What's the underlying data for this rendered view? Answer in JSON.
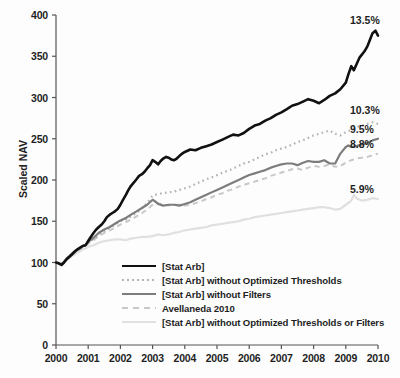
{
  "chart_data": {
    "type": "line",
    "title": "",
    "xlabel": "",
    "ylabel": "Scaled NAV",
    "xlim": [
      2000,
      2010
    ],
    "ylim": [
      0,
      400
    ],
    "grid": false,
    "legend_position": "inside-lower-center",
    "yticks": [
      0,
      50,
      100,
      150,
      200,
      250,
      300,
      350,
      400
    ],
    "xticks": [
      2000,
      2001,
      2002,
      2003,
      2004,
      2005,
      2006,
      2007,
      2008,
      2009,
      2010
    ],
    "ytick_labels": [
      "0",
      "50",
      "100",
      "150",
      "200",
      "250",
      "300",
      "350",
      "400"
    ],
    "xtick_labels": [
      "2000",
      "2001",
      "2002",
      "2003",
      "2004",
      "2005",
      "2006",
      "2007",
      "2008",
      "2009",
      "2010"
    ],
    "annotations": [
      {
        "text": "13.5%",
        "series": "[Stat Arb]",
        "x": 2010,
        "y": 375
      },
      {
        "text": "10.3%",
        "series": "[Stat Arb] without Optimized Thresholds",
        "x": 2010,
        "y": 268
      },
      {
        "text": "9.5%",
        "series": "[Stat Arb] without Filters",
        "x": 2010,
        "y": 250
      },
      {
        "text": "8.8%",
        "series": "Avellaneda 2010",
        "x": 2010,
        "y": 232
      },
      {
        "text": "5.9%",
        "series": "[Stat Arb] without Optimized Thresholds or Filters",
        "x": 2010,
        "y": 177
      }
    ],
    "series": [
      {
        "name": "[Stat Arb]",
        "color": "#111111",
        "style": "solid",
        "width": 2.6,
        "final_value": 375,
        "annual_return": "13.5%",
        "x": [
          2000.0,
          2000.08,
          2000.17,
          2000.25,
          2000.33,
          2000.42,
          2000.5,
          2000.58,
          2000.67,
          2000.75,
          2000.83,
          2000.92,
          2001.0,
          2001.08,
          2001.17,
          2001.25,
          2001.33,
          2001.42,
          2001.5,
          2001.58,
          2001.67,
          2001.75,
          2001.83,
          2001.92,
          2002.0,
          2002.08,
          2002.17,
          2002.25,
          2002.33,
          2002.42,
          2002.5,
          2002.58,
          2002.67,
          2002.75,
          2002.83,
          2002.92,
          2003.0,
          2003.08,
          2003.17,
          2003.25,
          2003.33,
          2003.42,
          2003.5,
          2003.58,
          2003.67,
          2003.75,
          2003.83,
          2003.92,
          2004.0,
          2004.17,
          2004.33,
          2004.5,
          2004.67,
          2004.83,
          2005.0,
          2005.17,
          2005.33,
          2005.5,
          2005.67,
          2005.83,
          2006.0,
          2006.17,
          2006.33,
          2006.5,
          2006.67,
          2006.83,
          2007.0,
          2007.17,
          2007.33,
          2007.5,
          2007.67,
          2007.83,
          2008.0,
          2008.17,
          2008.33,
          2008.5,
          2008.67,
          2008.83,
          2009.0,
          2009.08,
          2009.17,
          2009.25,
          2009.33,
          2009.42,
          2009.5,
          2009.58,
          2009.67,
          2009.75,
          2009.83,
          2009.92,
          2010.0
        ],
        "y": [
          100,
          99,
          97,
          100,
          104,
          107,
          110,
          113,
          116,
          118,
          120,
          121,
          126,
          131,
          136,
          140,
          143,
          146,
          150,
          155,
          158,
          160,
          162,
          165,
          170,
          176,
          182,
          188,
          193,
          197,
          201,
          205,
          207,
          210,
          214,
          218,
          224,
          222,
          219,
          223,
          226,
          228,
          227,
          225,
          224,
          226,
          229,
          232,
          234,
          237,
          236,
          239,
          241,
          243,
          246,
          249,
          252,
          255,
          254,
          257,
          262,
          266,
          268,
          272,
          275,
          279,
          282,
          286,
          290,
          292,
          295,
          298,
          296,
          293,
          297,
          302,
          305,
          310,
          318,
          328,
          338,
          333,
          340,
          348,
          352,
          356,
          362,
          370,
          378,
          381,
          375
        ]
      },
      {
        "name": "[Stat Arb] without Optimized Thresholds",
        "color": "#b4b4b4",
        "style": "dotted",
        "width": 2.2,
        "final_value": 268,
        "annual_return": "10.3%",
        "x": [
          2000.0,
          2000.08,
          2000.17,
          2000.25,
          2000.33,
          2000.42,
          2000.5,
          2000.58,
          2000.67,
          2000.75,
          2000.83,
          2000.92,
          2001.0,
          2001.17,
          2001.33,
          2001.5,
          2001.67,
          2001.83,
          2002.0,
          2002.17,
          2002.33,
          2002.5,
          2002.67,
          2002.83,
          2003.0,
          2003.17,
          2003.33,
          2003.5,
          2003.67,
          2003.83,
          2004.0,
          2004.17,
          2004.33,
          2004.5,
          2004.67,
          2004.83,
          2005.0,
          2005.17,
          2005.33,
          2005.5,
          2005.67,
          2005.83,
          2006.0,
          2006.17,
          2006.33,
          2006.5,
          2006.67,
          2006.83,
          2007.0,
          2007.17,
          2007.33,
          2007.5,
          2007.67,
          2007.83,
          2008.0,
          2008.17,
          2008.33,
          2008.5,
          2008.67,
          2008.83,
          2009.0,
          2009.17,
          2009.33,
          2009.5,
          2009.67,
          2009.83,
          2010.0
        ],
        "y": [
          100,
          99,
          98,
          101,
          105,
          108,
          110,
          113,
          115,
          117,
          119,
          121,
          124,
          129,
          134,
          138,
          142,
          146,
          150,
          152,
          156,
          160,
          166,
          172,
          181,
          183,
          184,
          185,
          186,
          188,
          190,
          192,
          195,
          198,
          201,
          203,
          206,
          209,
          211,
          214,
          217,
          220,
          222,
          225,
          228,
          231,
          233,
          236,
          238,
          240,
          243,
          246,
          248,
          251,
          254,
          256,
          258,
          260,
          256,
          254,
          258,
          261,
          264,
          266,
          268,
          270,
          268
        ]
      },
      {
        "name": "[Stat Arb] without Filters",
        "color": "#7d7d7d",
        "style": "solid",
        "width": 2.2,
        "final_value": 250,
        "annual_return": "9.5%",
        "x": [
          2000.0,
          2000.08,
          2000.17,
          2000.25,
          2000.33,
          2000.42,
          2000.5,
          2000.58,
          2000.67,
          2000.75,
          2000.83,
          2000.92,
          2001.0,
          2001.17,
          2001.33,
          2001.5,
          2001.67,
          2001.83,
          2002.0,
          2002.17,
          2002.33,
          2002.5,
          2002.67,
          2002.83,
          2003.0,
          2003.08,
          2003.17,
          2003.33,
          2003.5,
          2003.67,
          2003.83,
          2004.0,
          2004.17,
          2004.33,
          2004.5,
          2004.67,
          2004.83,
          2005.0,
          2005.17,
          2005.33,
          2005.5,
          2005.67,
          2005.83,
          2006.0,
          2006.17,
          2006.33,
          2006.5,
          2006.67,
          2006.83,
          2007.0,
          2007.17,
          2007.33,
          2007.5,
          2007.67,
          2007.83,
          2008.0,
          2008.17,
          2008.33,
          2008.5,
          2008.67,
          2008.83,
          2009.0,
          2009.08,
          2009.17,
          2009.33,
          2009.5,
          2009.67,
          2009.83,
          2010.0
        ],
        "y": [
          100,
          99,
          98,
          101,
          105,
          108,
          111,
          114,
          116,
          118,
          120,
          121,
          125,
          130,
          136,
          140,
          143,
          147,
          151,
          154,
          158,
          162,
          166,
          170,
          176,
          174,
          171,
          169,
          170,
          170,
          169,
          171,
          173,
          176,
          179,
          182,
          185,
          188,
          191,
          194,
          197,
          200,
          203,
          206,
          208,
          210,
          212,
          215,
          217,
          219,
          220,
          220,
          218,
          221,
          223,
          222,
          222,
          224,
          220,
          220,
          232,
          240,
          242,
          240,
          241,
          243,
          245,
          248,
          250
        ]
      },
      {
        "name": "Avellaneda 2010",
        "color": "#c8c8c8",
        "style": "dashed",
        "width": 2.0,
        "final_value": 232,
        "annual_return": "8.8%",
        "x": [
          2000.0,
          2000.08,
          2000.17,
          2000.25,
          2000.33,
          2000.42,
          2000.5,
          2000.58,
          2000.67,
          2000.75,
          2000.83,
          2000.92,
          2001.0,
          2001.17,
          2001.33,
          2001.5,
          2001.67,
          2001.83,
          2002.0,
          2002.17,
          2002.33,
          2002.5,
          2002.67,
          2002.83,
          2003.0,
          2003.17,
          2003.33,
          2003.5,
          2003.67,
          2003.83,
          2004.0,
          2004.17,
          2004.33,
          2004.5,
          2004.67,
          2004.83,
          2005.0,
          2005.17,
          2005.33,
          2005.5,
          2005.67,
          2005.83,
          2006.0,
          2006.17,
          2006.33,
          2006.5,
          2006.67,
          2006.83,
          2007.0,
          2007.17,
          2007.33,
          2007.5,
          2007.67,
          2007.83,
          2008.0,
          2008.17,
          2008.33,
          2008.5,
          2008.67,
          2008.83,
          2009.0,
          2009.17,
          2009.33,
          2009.5,
          2009.67,
          2009.83,
          2010.0
        ],
        "y": [
          100,
          99,
          98,
          100,
          104,
          107,
          109,
          112,
          114,
          116,
          118,
          120,
          123,
          127,
          132,
          136,
          139,
          142,
          146,
          149,
          152,
          156,
          160,
          164,
          170,
          172,
          170,
          169,
          170,
          170,
          169,
          170,
          172,
          174,
          177,
          179,
          182,
          184,
          187,
          189,
          192,
          194,
          196,
          198,
          200,
          202,
          205,
          207,
          209,
          211,
          213,
          214,
          212,
          215,
          217,
          216,
          217,
          219,
          216,
          217,
          221,
          224,
          226,
          227,
          228,
          230,
          232
        ]
      },
      {
        "name": "[Stat Arb] without Optimized Thresholds or Filters",
        "color": "#e0e0e0",
        "style": "solid",
        "width": 2.2,
        "final_value": 177,
        "annual_return": "5.9%",
        "x": [
          2000.0,
          2000.08,
          2000.17,
          2000.25,
          2000.33,
          2000.42,
          2000.5,
          2000.58,
          2000.67,
          2000.75,
          2000.83,
          2000.92,
          2001.0,
          2001.17,
          2001.33,
          2001.5,
          2001.67,
          2001.83,
          2002.0,
          2002.17,
          2002.33,
          2002.5,
          2002.67,
          2002.83,
          2003.0,
          2003.17,
          2003.33,
          2003.5,
          2003.67,
          2003.83,
          2004.0,
          2004.17,
          2004.33,
          2004.5,
          2004.67,
          2004.83,
          2005.0,
          2005.17,
          2005.33,
          2005.5,
          2005.67,
          2005.83,
          2006.0,
          2006.17,
          2006.33,
          2006.5,
          2006.67,
          2006.83,
          2007.0,
          2007.17,
          2007.33,
          2007.5,
          2007.67,
          2007.83,
          2008.0,
          2008.17,
          2008.33,
          2008.5,
          2008.67,
          2008.83,
          2009.0,
          2009.17,
          2009.25,
          2009.33,
          2009.5,
          2009.67,
          2009.83,
          2010.0
        ],
        "y": [
          100,
          99,
          98,
          100,
          103,
          106,
          108,
          110,
          112,
          114,
          116,
          117,
          119,
          121,
          124,
          126,
          127,
          128,
          128,
          127,
          129,
          130,
          131,
          131,
          132,
          134,
          133,
          134,
          136,
          137,
          139,
          140,
          141,
          142,
          143,
          145,
          146,
          147,
          148,
          149,
          150,
          152,
          153,
          155,
          156,
          157,
          158,
          159,
          160,
          161,
          162,
          163,
          164,
          165,
          166,
          167,
          167,
          166,
          164,
          165,
          170,
          175,
          182,
          178,
          175,
          176,
          178,
          177
        ]
      }
    ]
  },
  "axis": {
    "y_title": "Scaled NAV"
  },
  "legend": {
    "items": [
      {
        "label": "[Stat Arb]",
        "color": "#111111",
        "style": "solid",
        "width": 2.8
      },
      {
        "label": "[Stat Arb] without Optimized Thresholds",
        "color": "#b4b4b4",
        "style": "dotted",
        "width": 2.4
      },
      {
        "label": "[Stat Arb] without Filters",
        "color": "#7d7d7d",
        "style": "solid",
        "width": 2.4
      },
      {
        "label": "Avellaneda 2010",
        "color": "#c8c8c8",
        "style": "dashed",
        "width": 2.2
      },
      {
        "label": "[Stat Arb] without Optimized Thresholds or Filters",
        "color": "#e0e0e0",
        "style": "solid",
        "width": 2.4
      }
    ]
  }
}
